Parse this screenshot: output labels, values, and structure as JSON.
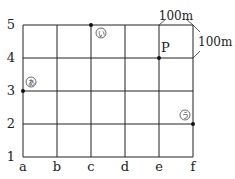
{
  "diagram": {
    "x_labels": [
      "a",
      "b",
      "c",
      "d",
      "e",
      "f"
    ],
    "y_labels": [
      "1",
      "2",
      "3",
      "4",
      "5"
    ],
    "scale": {
      "horizontal": "100m",
      "vertical": "100m"
    },
    "points": [
      {
        "id": "i",
        "label": "い",
        "col": "c",
        "row": "5",
        "circled": true
      },
      {
        "id": "P",
        "label": "P",
        "col": "e",
        "row": "4",
        "circled": false
      },
      {
        "id": "a",
        "label": "あ",
        "col": "a",
        "row": "3",
        "circled": true
      },
      {
        "id": "u",
        "label": "う",
        "col": "f",
        "row": "2",
        "circled": true
      }
    ]
  }
}
